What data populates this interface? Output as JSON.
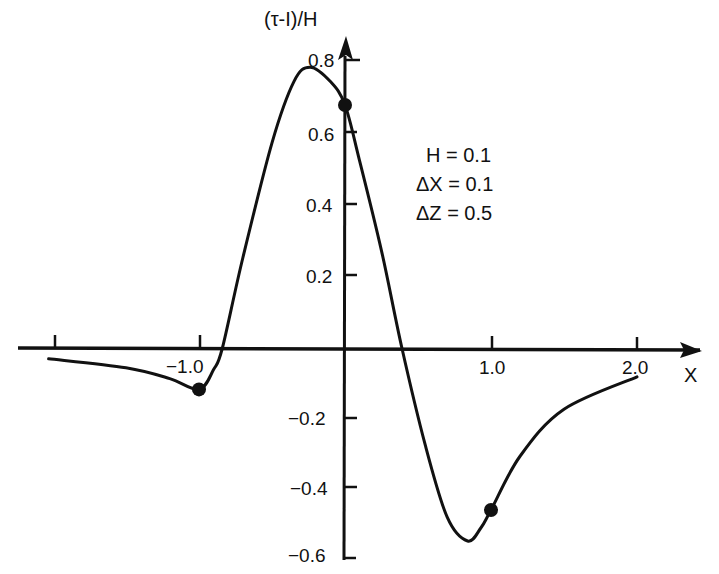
{
  "chart_data": {
    "type": "line",
    "title": "",
    "xlabel": "X",
    "ylabel": "(τ-I)/H",
    "xlim": [
      -2.05,
      2.45
    ],
    "ylim": [
      -0.6,
      0.85
    ],
    "grid": false,
    "legend": null,
    "x_ticks": [
      -2.0,
      -1.0,
      1.0,
      2.0
    ],
    "x_tick_labels": [
      "",
      "−1.0",
      "1.0",
      "2.0"
    ],
    "y_ticks": [
      0.8,
      0.6,
      0.4,
      0.2,
      -0.2,
      -0.4,
      -0.6
    ],
    "y_tick_labels": [
      "0.8",
      "0.6",
      "0.4",
      "0.2",
      "−0.2",
      "−0.4",
      "−0.6"
    ],
    "annotations": [
      "H = 0.1",
      "ΔX = 0.1",
      "ΔZ = 0.5"
    ],
    "series": [
      {
        "name": "(τ-I)/H",
        "x": [
          -2.03,
          -1.5,
          -1.2,
          -1.0,
          -0.9,
          -0.84,
          -0.7,
          -0.5,
          -0.35,
          -0.24,
          -0.1,
          0.0,
          0.1,
          0.25,
          0.39,
          0.55,
          0.7,
          0.84,
          0.93,
          1.0,
          1.2,
          1.5,
          2.0
        ],
        "y": [
          -0.03,
          -0.055,
          -0.085,
          -0.115,
          -0.06,
          0.0,
          0.25,
          0.57,
          0.74,
          0.78,
          0.74,
          0.675,
          0.52,
          0.27,
          0.0,
          -0.27,
          -0.47,
          -0.536,
          -0.5,
          -0.45,
          -0.3,
          -0.17,
          -0.08
        ]
      }
    ],
    "markers": [
      {
        "x": -1.0,
        "y": -0.115
      },
      {
        "x": 0.0,
        "y": 0.675
      },
      {
        "x": 1.0,
        "y": -0.45
      }
    ]
  },
  "labels": {
    "ylabel": "(τ-I)/H",
    "xlabel": "X",
    "y_ticks": {
      "p08": "0.8",
      "p06": "0.6",
      "p04": "0.4",
      "p02": "0.2",
      "m02": "−0.2",
      "m04": "−0.4",
      "m06": "−0.6"
    },
    "x_ticks": {
      "m1": "−1.0",
      "p1": "1.0",
      "p2": "2.0"
    },
    "params": {
      "h": "H = 0.1",
      "dx": "ΔX = 0.1",
      "dz": "ΔZ = 0.5"
    }
  },
  "style": {
    "line_color": "#111111",
    "axis_color": "#111111",
    "background": "#ffffff"
  }
}
